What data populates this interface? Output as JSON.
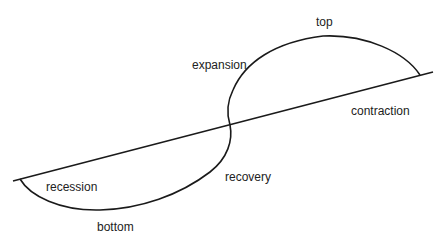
{
  "diagram": {
    "title_partial": "",
    "trend_line": {
      "from": [
        13,
        181
      ],
      "to": [
        433,
        72
      ]
    },
    "labels": {
      "top": "top",
      "expansion": "expansion",
      "contraction": "contraction",
      "recession": "recession",
      "recovery": "recovery",
      "bottom": "bottom"
    },
    "colors": {
      "stroke": "#1a1a1a",
      "text": "#222222"
    }
  }
}
